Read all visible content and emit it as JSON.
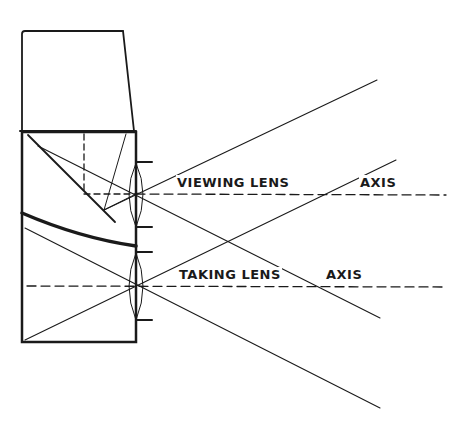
{
  "diagram": {
    "labels": {
      "viewing_lens": "VIEWING LENS",
      "viewing_axis": "AXIS",
      "taking_lens": "TAKING LENS",
      "taking_axis": "AXIS"
    },
    "colors": {
      "ink": "#1a1a1a",
      "background": "#ffffff"
    }
  }
}
